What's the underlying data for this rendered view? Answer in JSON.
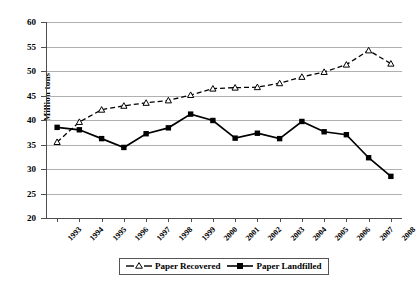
{
  "chart_data": {
    "type": "line",
    "title": "",
    "xlabel": "",
    "ylabel": "Million tons",
    "ylim": [
      20,
      60
    ],
    "ytick_step": 5,
    "yticks": [
      60,
      55,
      50,
      45,
      40,
      35,
      30,
      25,
      20
    ],
    "grid": true,
    "legend_position": "bottom",
    "categories": [
      "1993",
      "1994",
      "1995",
      "1996",
      "1997",
      "1998",
      "1999",
      "2000",
      "2001",
      "2002",
      "2003",
      "2004",
      "2005",
      "2006",
      "2007",
      "2008"
    ],
    "series": [
      {
        "name": "Paper Recovered",
        "marker": "open-triangle",
        "line_style": "dashed",
        "color": "#000000",
        "values": [
          35.5,
          39.6,
          42.1,
          42.9,
          43.5,
          44.0,
          45.1,
          46.4,
          46.6,
          46.7,
          47.5,
          48.8,
          49.8,
          51.3,
          54.2,
          51.5
        ]
      },
      {
        "name": "Paper Landfilled",
        "marker": "filled-square",
        "line_style": "solid",
        "color": "#000000",
        "values": [
          38.5,
          38.0,
          36.2,
          34.4,
          37.2,
          38.4,
          41.2,
          39.9,
          36.3,
          37.3,
          36.2,
          39.7,
          37.6,
          37.0,
          32.3,
          28.5
        ]
      }
    ]
  },
  "legend": {
    "items": [
      {
        "label": "Paper Recovered"
      },
      {
        "label": "Paper Landfilled"
      }
    ]
  }
}
